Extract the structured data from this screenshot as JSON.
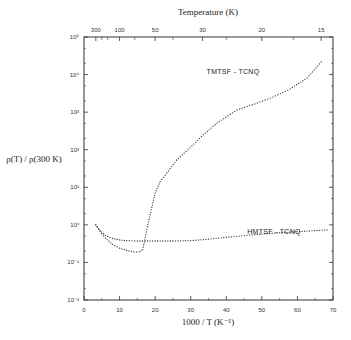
{
  "chart_data": {
    "type": "scatter",
    "title": "",
    "xlabel": "1000 / T (K⁻¹)",
    "ylabel": "ρ(T) / ρ(300 K)",
    "top_xlabel": "Temperature (K)",
    "xlim": [
      0,
      70
    ],
    "ylim": [
      0.01,
      100000
    ],
    "yscale": "log",
    "x_ticks": [
      0,
      10,
      20,
      30,
      40,
      50,
      60,
      70
    ],
    "x_tick_labels": [
      "0",
      "10",
      "20",
      "30",
      "40",
      "50",
      "60",
      "70"
    ],
    "y_ticks_log": [
      -2,
      -1,
      0,
      1,
      2,
      3,
      4,
      5
    ],
    "y_tick_labels": [
      "10⁻²",
      "10⁻¹",
      "10⁰",
      "10¹",
      "10²",
      "10³",
      "10⁴",
      "10⁵"
    ],
    "top_ticks_temperature": [
      300,
      100,
      50,
      30,
      20,
      15
    ],
    "top_tick_labels": [
      "300",
      "100",
      "50",
      "30",
      "20",
      "15"
    ],
    "grid": false,
    "legend": "inline labels",
    "series": [
      {
        "name": "TMTSF - TCNQ",
        "x": [
          3.3,
          4.5,
          6,
          8,
          10,
          12,
          14,
          15.5,
          16.5,
          17.1,
          17.8,
          18.6,
          20,
          21.4,
          23.3,
          26,
          29.8,
          33,
          37.4,
          43,
          48,
          53.1,
          58,
          62.7,
          67.2
        ],
        "log10_y": [
          0.0,
          -0.18,
          -0.35,
          -0.52,
          -0.62,
          -0.68,
          -0.72,
          -0.72,
          -0.66,
          -0.4,
          -0.05,
          0.27,
          0.85,
          1.15,
          1.38,
          1.72,
          2.05,
          2.35,
          2.71,
          3.06,
          3.22,
          3.4,
          3.62,
          3.91,
          4.39
        ]
      },
      {
        "name": "HMTSF - TCNQ",
        "x": [
          3.3,
          4.5,
          6,
          8,
          10,
          12,
          15,
          20,
          25,
          30,
          35,
          40,
          48,
          55,
          62,
          69
        ],
        "log10_y": [
          0.0,
          -0.15,
          -0.28,
          -0.36,
          -0.4,
          -0.42,
          -0.43,
          -0.43,
          -0.43,
          -0.42,
          -0.38,
          -0.33,
          -0.26,
          -0.21,
          -0.17,
          -0.13
        ]
      }
    ]
  }
}
